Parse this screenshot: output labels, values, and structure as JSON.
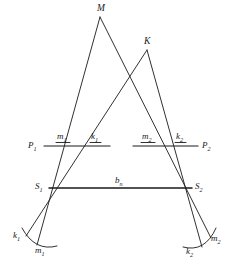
{
  "figure": {
    "type": "geometric-survey-diagram",
    "background_color": "#ffffff",
    "stroke_color": "#1a1a1a"
  },
  "points": {
    "apex_m": {
      "label": "M",
      "x": 100,
      "y": 14
    },
    "apex_k": {
      "label": "K",
      "x": 147,
      "y": 47
    },
    "station_s1": {
      "label": "S",
      "sub": "1",
      "x": 49,
      "y": 188
    },
    "station_s2": {
      "label": "S",
      "sub": "2",
      "x": 192,
      "y": 188
    }
  },
  "baseline": {
    "label": "b",
    "sub": "n",
    "from_x": 49,
    "from_y": 188,
    "to_x": 192,
    "to_y": 188
  },
  "parallels": [
    {
      "name": "P1",
      "label": "P",
      "sub": "1",
      "x1": 44,
      "x2": 110,
      "y": 146
    },
    {
      "name": "P2",
      "label": "P",
      "sub": "2",
      "x1": 133,
      "x2": 198,
      "y": 146
    }
  ],
  "parallel_marks": [
    {
      "name": "m1",
      "label": "m",
      "sub": "1",
      "x": 61,
      "y": 138
    },
    {
      "name": "k1",
      "label": "k",
      "sub": "1",
      "x": 95,
      "y": 138
    },
    {
      "name": "m2",
      "label": "m",
      "sub": "2",
      "x": 146,
      "y": 138
    },
    {
      "name": "k2",
      "label": "k",
      "sub": "2",
      "x": 180,
      "y": 138
    }
  ],
  "arc_labels": [
    {
      "name": "k1-arc",
      "label": "k",
      "sub": "1",
      "x": 18,
      "y": 237
    },
    {
      "name": "m1-arc",
      "label": "m",
      "sub": "1",
      "x": 40,
      "y": 250
    },
    {
      "name": "m2-arc",
      "label": "m",
      "sub": "2",
      "x": 214,
      "y": 240
    },
    {
      "name": "k2-arc",
      "label": "k",
      "sub": "2",
      "x": 190,
      "y": 252
    }
  ],
  "rays": [
    {
      "name": "m-to-s1",
      "from": "M",
      "to": "S1"
    },
    {
      "name": "m-to-s2",
      "from": "M",
      "to": "S2"
    },
    {
      "name": "k-to-s1",
      "from": "K",
      "to": "S1"
    },
    {
      "name": "k-to-s2",
      "from": "K",
      "to": "S2"
    }
  ]
}
